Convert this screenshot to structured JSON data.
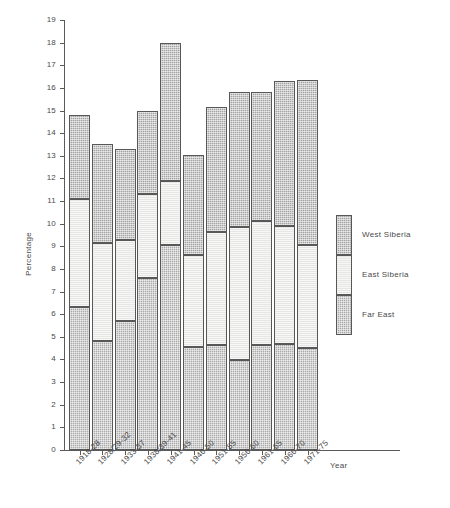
{
  "chart_data": {
    "type": "bar",
    "subtype": "stacked",
    "title": "",
    "xlabel": "Year",
    "ylabel": "Percentage",
    "ylim": [
      0,
      19
    ],
    "ytick_step": 1,
    "yticks": [
      "0",
      "1",
      "2",
      "3",
      "4",
      "5",
      "6",
      "7",
      "8",
      "9",
      "10",
      "11",
      "12",
      "13",
      "14",
      "15",
      "16",
      "17",
      "18",
      "19"
    ],
    "grid": false,
    "legend_position": "right",
    "categories": [
      "1918-28",
      "1928/29-32",
      "1933-37",
      "1938/39-41",
      "1941-45",
      "1946-50",
      "1951-55",
      "1956-60",
      "1961-65",
      "1966-70",
      "1971-75"
    ],
    "series": [
      {
        "name": "Far East",
        "color": "#aaaaaa",
        "values": [
          6.3,
          4.8,
          5.7,
          7.6,
          9.05,
          4.55,
          4.65,
          3.98,
          4.65,
          4.7,
          4.5
        ]
      },
      {
        "name": "East Siberia",
        "color": "#e6e6e4",
        "values": [
          4.8,
          4.35,
          3.6,
          3.7,
          2.85,
          4.05,
          5.0,
          5.87,
          5.45,
          5.2,
          4.55
        ]
      },
      {
        "name": "West Siberia",
        "color": "#a3a3a3",
        "values": [
          3.7,
          4.35,
          4.0,
          3.7,
          6.1,
          4.45,
          5.5,
          5.95,
          5.7,
          6.4,
          7.3
        ]
      }
    ],
    "totals": [
      14.8,
      13.5,
      13.3,
      15.0,
      18.0,
      13.05,
      15.15,
      15.8,
      15.8,
      16.3,
      16.35
    ]
  },
  "legend": {
    "items": [
      {
        "label": "West Siberia",
        "fill": "#a3a3a3"
      },
      {
        "label": "East Siberia",
        "fill": "#e6e6e4"
      },
      {
        "label": "Far East",
        "fill": "#aaaaaa"
      }
    ]
  },
  "axes": {
    "y_title": "Percentage",
    "x_title": "Year"
  }
}
